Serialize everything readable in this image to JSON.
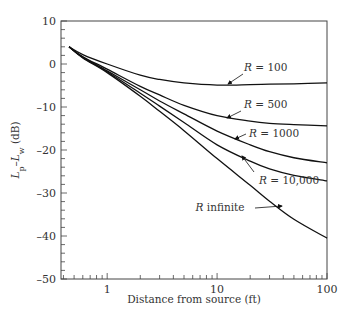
{
  "chart_data": {
    "type": "line",
    "title": "",
    "xlabel": "Distance from source (ft)",
    "ylabel": "Lp–Lw (dB)",
    "xscale": "log",
    "xlim": [
      0.38,
      100
    ],
    "ylim": [
      -50,
      10
    ],
    "x_ticks": [
      1,
      10,
      100
    ],
    "x_tick_labels": [
      "1",
      "10",
      "100"
    ],
    "y_ticks": [
      10,
      0,
      -10,
      -20,
      -30,
      -40,
      -50
    ],
    "y_tick_labels": [
      "10",
      "0",
      "–10",
      "–20",
      "–30",
      "–40",
      "–50"
    ],
    "grid": false,
    "legend": "inline labels with arrows",
    "x": [
      0.45,
      0.6,
      1,
      2,
      3,
      5,
      10,
      20,
      30,
      50,
      100
    ],
    "series": [
      {
        "name": "R = 100",
        "values": [
          4,
          2.2,
          0,
          -2.6,
          -3.6,
          -4.4,
          -4.9,
          -4.8,
          -4.7,
          -4.6,
          -4.4
        ]
      },
      {
        "name": "R = 500",
        "values": [
          4,
          1.7,
          -1.2,
          -5.2,
          -7.2,
          -9.6,
          -12.0,
          -13.3,
          -13.8,
          -14.1,
          -14.4
        ]
      },
      {
        "name": "R = 1000",
        "values": [
          4,
          1.6,
          -1.6,
          -6.0,
          -8.6,
          -11.6,
          -15.6,
          -18.8,
          -20.4,
          -21.8,
          -23.0
        ]
      },
      {
        "name": "R = 10,000",
        "values": [
          4,
          1.5,
          -1.8,
          -6.8,
          -9.8,
          -13.6,
          -18.8,
          -22.6,
          -24.4,
          -25.9,
          -27.2
        ]
      },
      {
        "name": "R infinite",
        "values": [
          4,
          1.4,
          -2.0,
          -7.5,
          -11.0,
          -15.5,
          -22.0,
          -28.2,
          -31.9,
          -36.1,
          -40.5
        ]
      }
    ],
    "annotations": [
      {
        "text": "R = 100",
        "x": 20,
        "y": 0.5
      },
      {
        "text": "R = 500",
        "x": 20,
        "y": -9
      },
      {
        "text": "R = 1000",
        "x": 25,
        "y": -17
      },
      {
        "text": "R = 10,000",
        "x": 28,
        "y": -27
      },
      {
        "text": "R infinite",
        "x": 8,
        "y": -36
      }
    ]
  }
}
